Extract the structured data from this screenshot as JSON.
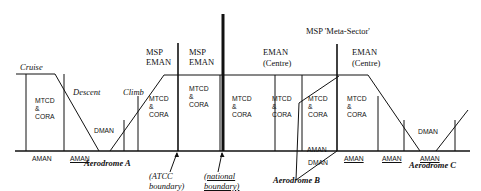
{
  "phases": {
    "cruise": "Cruise",
    "descent": "Descent",
    "climb": "Climb"
  },
  "tools": {
    "mtcd": "MTCD",
    "amp": "&",
    "cora": "CORA",
    "aman": "AMAN",
    "dman": "DMAN"
  },
  "headers": {
    "msp_1": "MSP",
    "eman_1": "EMAN",
    "msp_2": "MSP",
    "eman_2": "EMAN",
    "eman_centre_1": "EMAN",
    "centre_1": "(Centre)",
    "meta_sector": "MSP 'Meta-Sector'",
    "eman_centre_2": "EMAN",
    "centre_2": "(Centre)"
  },
  "boundaries": {
    "atcc_line1": "(ATCC",
    "atcc_line2": "boundary)",
    "national_line1": "(national",
    "national_line2": "boundary)"
  },
  "aerodromes": {
    "a": "Aerodrome A",
    "b": "Aerodrome B",
    "c": "Aerodrome C"
  }
}
